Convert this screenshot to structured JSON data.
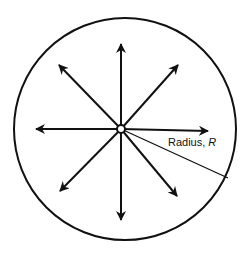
{
  "diagram": {
    "label_prefix": "Radius, ",
    "label_symbol": "R",
    "colors": {
      "stroke": "#111111",
      "background": "#ffffff"
    }
  }
}
